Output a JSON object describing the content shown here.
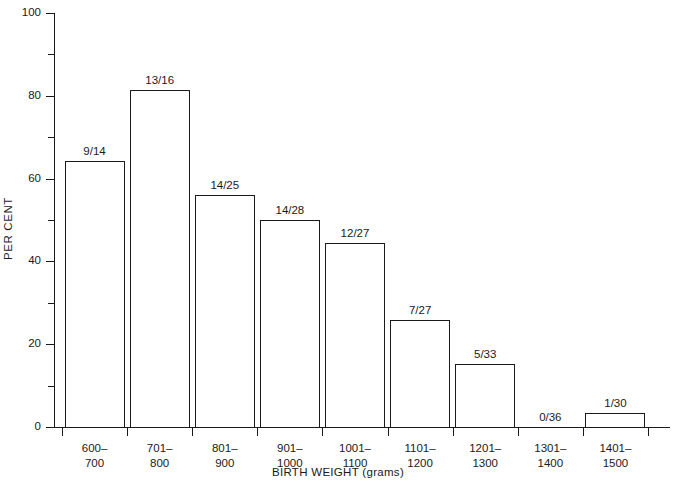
{
  "chart_data": {
    "type": "bar",
    "title": "",
    "xlabel": "BIRTH WEIGHT (grams)",
    "ylabel": "PER CENT",
    "ylim": [
      0,
      100
    ],
    "grid": false,
    "legend": "none",
    "y_major_ticks": [
      0,
      20,
      40,
      60,
      80,
      100
    ],
    "y_minor_ticks": [
      10,
      30,
      50,
      70,
      90
    ],
    "y_tick_labels": [
      "0",
      "20",
      "40",
      "60",
      "80",
      "100"
    ],
    "categories": [
      "600–\n700",
      "701–\n800",
      "801–\n900",
      "901–\n1000",
      "1001–\n1100",
      "1101–\n1200",
      "1201–\n1300",
      "1301–\n1400",
      "1401–\n1500"
    ],
    "category_lines": [
      [
        "600–",
        "700"
      ],
      [
        "701–",
        "800"
      ],
      [
        "801–",
        "900"
      ],
      [
        "901–",
        "1000"
      ],
      [
        "1001–",
        "1100"
      ],
      [
        "1101–",
        "1200"
      ],
      [
        "1201–",
        "1300"
      ],
      [
        "1301–",
        "1400"
      ],
      [
        "1401–",
        "1500"
      ]
    ],
    "values": [
      64.3,
      81.3,
      56.0,
      50.0,
      44.4,
      25.9,
      15.2,
      0.0,
      3.3
    ],
    "point_labels": [
      "9/14",
      "13/16",
      "14/25",
      "14/28",
      "12/27",
      "7/27",
      "5/33",
      "0/36",
      "1/30"
    ],
    "numerators": [
      9,
      13,
      14,
      14,
      12,
      7,
      5,
      0,
      1
    ],
    "denominators": [
      14,
      16,
      25,
      28,
      27,
      27,
      33,
      36,
      30
    ],
    "bar_style": {
      "fill": "none",
      "edge_color": "#1a1a1a",
      "edge_width": 1
    }
  },
  "colors": {
    "background": "#ffffff",
    "ink": "#1a1a1a"
  }
}
